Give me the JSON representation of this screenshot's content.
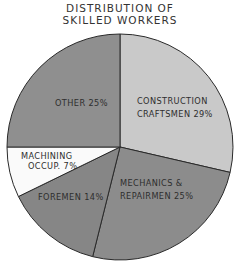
{
  "chart_data": {
    "type": "pie",
    "title": "DISTRIBUTION OF SKILLED WORKERS",
    "title_lines": [
      "DISTRIBUTION OF",
      "SKILLED WORKERS"
    ],
    "categories": [
      "Construction Craftsmen",
      "Mechanics & Repairmen",
      "Foremen",
      "Machining Occup.",
      "Other"
    ],
    "values": [
      29,
      25,
      14,
      7,
      25
    ],
    "unit": "%",
    "legend": "none (labels inside slices)",
    "slices": [
      {
        "label_lines": [
          "CONSTRUCTION",
          "CRAFTSMEN 29%"
        ],
        "value": 29,
        "color": "#c9c9c9",
        "start_deg": 0,
        "end_deg": 103
      },
      {
        "label_lines": [
          "MECHANICS &",
          "REPAIRMEN 25%"
        ],
        "value": 25,
        "color": "#8c8c8c",
        "start_deg": 103,
        "end_deg": 194
      },
      {
        "label_lines": [
          "FOREMEN 14%"
        ],
        "value": 14,
        "color": "#868686",
        "start_deg": 194,
        "end_deg": 244
      },
      {
        "label_lines": [
          "MACHINING",
          "OCCUP. 7%"
        ],
        "value": 7,
        "color": "#fafafa",
        "start_deg": 244,
        "end_deg": 270
      },
      {
        "label_lines": [
          "OTHER 25%"
        ],
        "value": 25,
        "color": "#8f8f8f",
        "start_deg": 270,
        "end_deg": 360
      }
    ]
  }
}
